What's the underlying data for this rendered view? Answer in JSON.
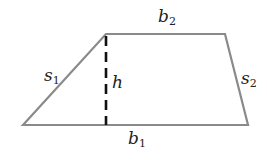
{
  "diagram": {
    "type": "trapezoid",
    "colors": {
      "edge": "#8a8a8a",
      "height_line": "#111111",
      "label": "#222222"
    },
    "vertices": {
      "bottom_left": [
        23,
        125
      ],
      "top_left": [
        106,
        34
      ],
      "top_right": [
        225,
        34
      ],
      "bottom_right": [
        248,
        125
      ]
    },
    "labels": {
      "b2": {
        "base": "b",
        "sub": "2"
      },
      "b1": {
        "base": "b",
        "sub": "1"
      },
      "s1": {
        "base": "s",
        "sub": "1"
      },
      "s2": {
        "base": "s",
        "sub": "2"
      },
      "h": {
        "base": "h"
      }
    }
  }
}
